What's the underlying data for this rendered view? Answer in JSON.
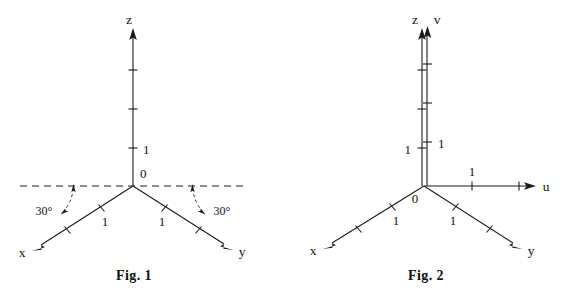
{
  "page": {
    "background_color": "#ffffff",
    "ink_color": "#1a1a1a",
    "width": 563,
    "height": 302
  },
  "figures": [
    {
      "id": "fig1",
      "caption": "Fig. 1",
      "origin_label": "0",
      "axes": [
        {
          "name": "z",
          "label": "z",
          "direction": "up",
          "tick_labels": [
            "1"
          ]
        },
        {
          "name": "x",
          "label": "x",
          "direction": "down-left",
          "tick_labels": [
            "1"
          ]
        },
        {
          "name": "y",
          "label": "y",
          "direction": "down-right",
          "tick_labels": [
            "1"
          ]
        }
      ],
      "angle_annotations": [
        {
          "label": "30°",
          "side": "left",
          "between": "dashed horizontal and x axis"
        },
        {
          "label": "30°",
          "side": "right",
          "between": "dashed horizontal and y axis"
        }
      ],
      "has_dashed_horizontal_reference": true
    },
    {
      "id": "fig2",
      "caption": "Fig. 2",
      "origin_label": "0",
      "axes": [
        {
          "name": "z",
          "label": "z",
          "direction": "up",
          "tick_labels": [
            "1"
          ]
        },
        {
          "name": "v",
          "label": "v",
          "direction": "up",
          "tick_labels": [
            "1"
          ]
        },
        {
          "name": "u",
          "label": "u",
          "direction": "right",
          "tick_labels": [
            "1"
          ]
        },
        {
          "name": "x",
          "label": "x",
          "direction": "down-left",
          "tick_labels": [
            "1"
          ]
        },
        {
          "name": "y",
          "label": "y",
          "direction": "down-right",
          "tick_labels": [
            "1"
          ]
        }
      ],
      "angle_annotations": [],
      "has_dashed_horizontal_reference": false
    }
  ],
  "fig1": {
    "caption": "Fig. 1",
    "origin": "0",
    "z_axis_label": "z",
    "x_axis_label": "x",
    "y_axis_label": "y",
    "z_unit_label": "1",
    "x_unit_label": "1",
    "y_unit_label": "1",
    "angle_left": "30°",
    "angle_right": "30°"
  },
  "fig2": {
    "caption": "Fig. 2",
    "origin": "0",
    "z_axis_label": "z",
    "v_axis_label": "v",
    "u_axis_label": "u",
    "x_axis_label": "x",
    "y_axis_label": "y",
    "z_unit_label": "1",
    "v_unit_label": "1",
    "u_unit_label": "1",
    "x_unit_label": "1",
    "y_unit_label": "1"
  }
}
